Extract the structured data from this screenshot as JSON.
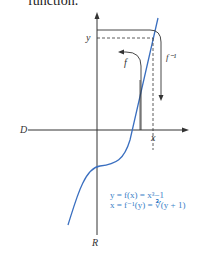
{
  "caption": "function.",
  "diagram": {
    "axis_labels": {
      "horizontal": "D",
      "vertical": "R"
    },
    "point_labels": {
      "x": "x",
      "y": "y"
    },
    "arrow_labels": {
      "forward": "f",
      "inverse": "f⁻¹"
    },
    "equations": [
      "y =  f(x) = x³−1",
      "x = f⁻¹(y) = ∛(y + 1)"
    ],
    "colors": {
      "curve": "#3a6fc0",
      "axes": "#333333",
      "equations": "#3a7fc8"
    }
  }
}
